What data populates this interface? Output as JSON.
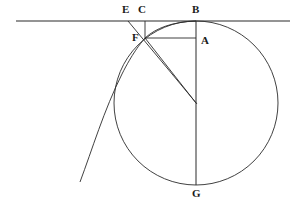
{
  "figure": {
    "width": 290,
    "height": 211,
    "background_color": "#ffffff",
    "stroke_color": "#2b2b2b",
    "label_color": "#1a1a1a"
  },
  "labels": [
    {
      "id": "E",
      "text": "E",
      "x": 122,
      "y": 4,
      "role": "point-label"
    },
    {
      "id": "C",
      "text": "C",
      "x": 138,
      "y": 4,
      "role": "point-label"
    },
    {
      "id": "B",
      "text": "B",
      "x": 192,
      "y": 4,
      "role": "point-label"
    },
    {
      "id": "F",
      "text": "F",
      "x": 132,
      "y": 32,
      "role": "point-label"
    },
    {
      "id": "A",
      "text": "A",
      "x": 201,
      "y": 35,
      "role": "point-label"
    },
    {
      "id": "G",
      "text": "G",
      "x": 192,
      "y": 188,
      "role": "point-label"
    }
  ],
  "geometry": {
    "circle": {
      "name": "rolling-circle",
      "cx": 196,
      "cy": 103,
      "r": 82
    },
    "points": {
      "A": {
        "x": 196,
        "y": 38
      },
      "B": {
        "x": 196,
        "y": 21
      },
      "C": {
        "x": 145,
        "y": 21
      },
      "E": {
        "x": 128,
        "y": 21
      },
      "F": {
        "x": 145,
        "y": 38
      },
      "G": {
        "x": 196,
        "y": 185
      },
      "O": {
        "x": 196,
        "y": 103
      }
    },
    "segments": [
      {
        "name": "baseline-tangent",
        "x1": 16,
        "y1": 21,
        "x2": 290,
        "y2": 21
      },
      {
        "name": "diameter-BG",
        "x1": 196,
        "y1": 21,
        "x2": 196,
        "y2": 185
      },
      {
        "name": "chord-FA",
        "x1": 145,
        "y1": 38,
        "x2": 196,
        "y2": 38
      },
      {
        "name": "ordinate-CF",
        "x1": 145,
        "y1": 21,
        "x2": 145,
        "y2": 38
      },
      {
        "name": "radius-OF",
        "x1": 145,
        "y1": 38,
        "x2": 196,
        "y2": 103
      },
      {
        "name": "tangent-EF",
        "x1": 128,
        "y1": 21,
        "x2": 197,
        "y2": 104
      }
    ],
    "curves": [
      {
        "name": "cycloid-arc",
        "path": "M 80 182 C 92 150 104 110 122 74 C 132 54 140 44 145 38 C 156 28 172 22 196 21",
        "description": "cycloid branch rising from lower-left through F to the apex B"
      }
    ]
  }
}
